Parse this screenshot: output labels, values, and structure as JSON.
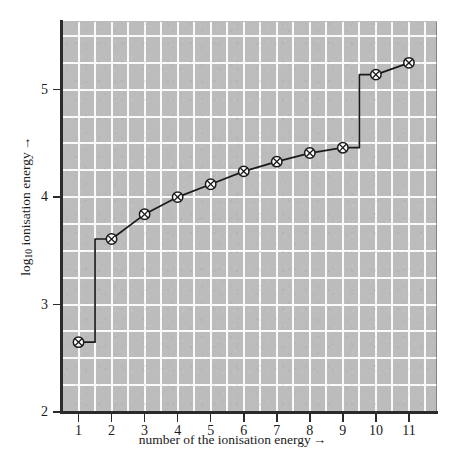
{
  "chart_data": {
    "type": "line",
    "title": "",
    "subtitle": "",
    "xlabel": "number of the ionisation energy",
    "xlabel_arrow": "→",
    "ylabel": "log",
    "ylabel_sub": "10",
    "ylabel_rest": " ionisation energy",
    "ylabel_arrow": "→",
    "ylabel_full": "log10 ionisation energy →",
    "x": [
      1,
      2,
      3,
      4,
      5,
      6,
      7,
      8,
      9,
      10,
      11
    ],
    "values": [
      2.65,
      3.61,
      3.84,
      4.0,
      4.12,
      4.24,
      4.33,
      4.41,
      4.46,
      5.14,
      5.25
    ],
    "series": [
      {
        "name": "log10 ionisation energy",
        "values": [
          2.65,
          3.61,
          3.84,
          4.0,
          4.12,
          4.24,
          4.33,
          4.41,
          4.46,
          5.14,
          5.25
        ]
      }
    ],
    "xtick_labels": [
      "1",
      "2",
      "3",
      "4",
      "5",
      "6",
      "7",
      "8",
      "9",
      "10",
      "11"
    ],
    "xticks": [
      1,
      2,
      3,
      4,
      5,
      6,
      7,
      8,
      9,
      10,
      11
    ],
    "ytick_labels": [
      "2",
      "3",
      "4",
      "5"
    ],
    "yticks": [
      2,
      3,
      4,
      5
    ],
    "xlim": [
      0.5,
      11.85
    ],
    "ylim": [
      2.0,
      5.63
    ],
    "grid": true,
    "grid_step_x": 0.5,
    "grid_step_y": 0.25,
    "legend": "none",
    "marker": "circle-with-cross",
    "line_color": "#1a1a1a",
    "marker_color": "#1a1a1a",
    "plot_background": "#bcbcbc",
    "grid_color": "#fafafa",
    "step_riser_positions": [
      1.5,
      9.5
    ],
    "annotations": []
  }
}
